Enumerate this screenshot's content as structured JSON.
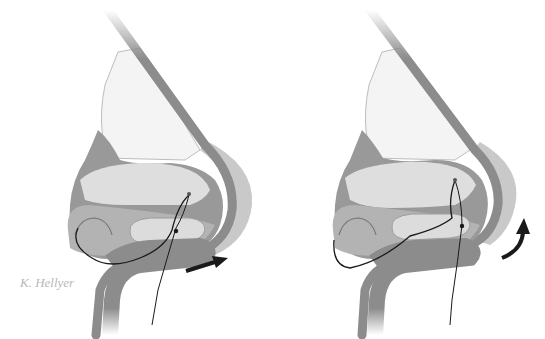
{
  "figure": {
    "panels": [
      {
        "id": "left",
        "caption": "",
        "arrow": "straight-right"
      },
      {
        "id": "right",
        "caption": "",
        "arrow": "curved-up"
      }
    ],
    "signature": "K. Hellyer",
    "colors": {
      "background": "#ffffff",
      "skin_dark": "#8c8c8c",
      "skin_mid": "#a8a8a8",
      "skin_light": "#c9c9c9",
      "cartilage_light": "#dcdcdc",
      "upper_lateral": "#f2f2f2",
      "suture": "#1a1a1a",
      "arrow": "#1a1a1a"
    }
  }
}
